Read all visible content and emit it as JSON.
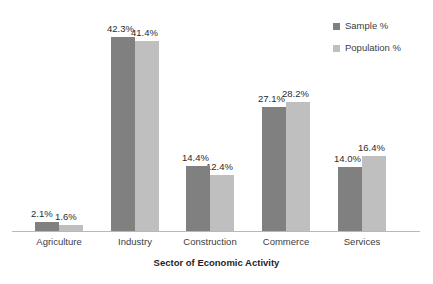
{
  "chart_data": {
    "type": "bar",
    "title": "",
    "xlabel": "Sector of Economic Activity",
    "ylabel": "",
    "ylim": [
      0,
      45
    ],
    "grid": false,
    "legend_position": "top-right",
    "categories": [
      "Agriculture",
      "Industry",
      "Construction",
      "Commerce",
      "Services"
    ],
    "series": [
      {
        "name": "Sample %",
        "color": "#808080",
        "values": [
          2.1,
          42.3,
          14.4,
          27.1,
          14.0
        ],
        "labels": [
          "2.1%",
          "42.3%",
          "14.4%",
          "27.1%",
          "14.0%"
        ]
      },
      {
        "name": "Population %",
        "color": "#bfbfbf",
        "values": [
          1.6,
          41.4,
          12.4,
          28.2,
          16.4
        ],
        "labels": [
          "1.6%",
          "41.4%",
          "12.4%",
          "28.2%",
          "16.4%"
        ]
      }
    ]
  },
  "legend": {
    "entries": [
      {
        "label": "Sample %",
        "color": "#808080"
      },
      {
        "label": "Population %",
        "color": "#bfbfbf"
      }
    ]
  },
  "axis": {
    "x_title": "Sector of Economic Activity",
    "baseline_color": "#b8b8b8"
  }
}
